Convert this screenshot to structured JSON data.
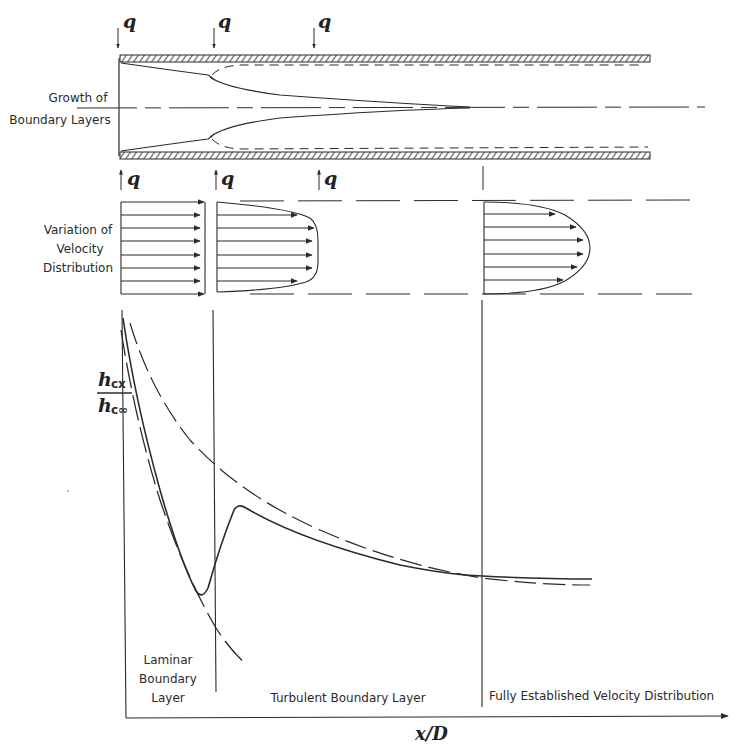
{
  "diagram": {
    "labels": {
      "growth_line1": "Growth of",
      "growth_line2": "Boundary Layers",
      "velocity_line1": "Variation of",
      "velocity_line2": "Velocity",
      "velocity_line3": "Distribution",
      "heat_flux_symbol": "q",
      "y_axis_numerator": "h",
      "y_axis_numerator_sub": "cx",
      "y_axis_denominator": "h",
      "y_axis_denominator_sub": "c∞",
      "x_axis": "x/D",
      "region_laminar_1": "Laminar",
      "region_laminar_2": "Boundary",
      "region_laminar_3": "Layer",
      "region_turbulent": "Turbulent Boundary Layer",
      "region_fully": "Fully Established Velocity Distribution"
    },
    "heat_flux_arrows": {
      "top_x": [
        118,
        212,
        316
      ],
      "bottom_x": [
        120,
        216,
        319
      ]
    },
    "colors": {
      "ink": "#2a2a2a",
      "background": "#ffffff"
    }
  }
}
